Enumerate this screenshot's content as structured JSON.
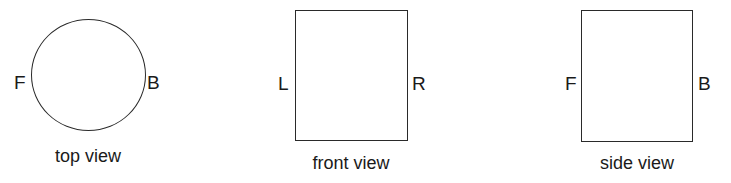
{
  "views": [
    {
      "shape": "circle",
      "caption": "top view",
      "left_label": "F",
      "right_label": "B"
    },
    {
      "shape": "rectangle",
      "caption": "front view",
      "left_label": "L",
      "right_label": "R"
    },
    {
      "shape": "rectangle",
      "caption": "side view",
      "left_label": "F",
      "right_label": "B"
    }
  ]
}
